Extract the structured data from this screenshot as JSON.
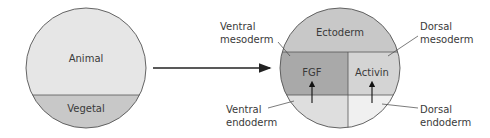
{
  "left_embryo": {
    "animal_label": "Animal",
    "vegetal_label": "Vegetal"
  },
  "right_embryo": {
    "ectoderm_label": "Ectoderm",
    "fgf_label": "FGF",
    "activin_label": "Activin"
  },
  "callouts": {
    "ventral_mesoderm_line1": "Ventral",
    "ventral_mesoderm_line2": "mesoderm",
    "dorsal_mesoderm_line1": "Dorsal",
    "dorsal_mesoderm_line2": "mesoderm",
    "ventral_endoderm_line1": "Ventral",
    "ventral_endoderm_line2": "endoderm",
    "dorsal_endoderm_line1": "Dorsal",
    "dorsal_endoderm_line2": "endoderm"
  },
  "colors": {
    "animal": "#e6e6e6",
    "vegetal": "#c8c8c8",
    "ectoderm": "#c8c8c8",
    "ventral_mesoderm": "#a9a9a9",
    "dorsal_mesoderm": "#d4d4d4",
    "ventral_endoderm": "#dedede",
    "dorsal_endoderm": "#f0f0f0",
    "outline": "#555555"
  }
}
